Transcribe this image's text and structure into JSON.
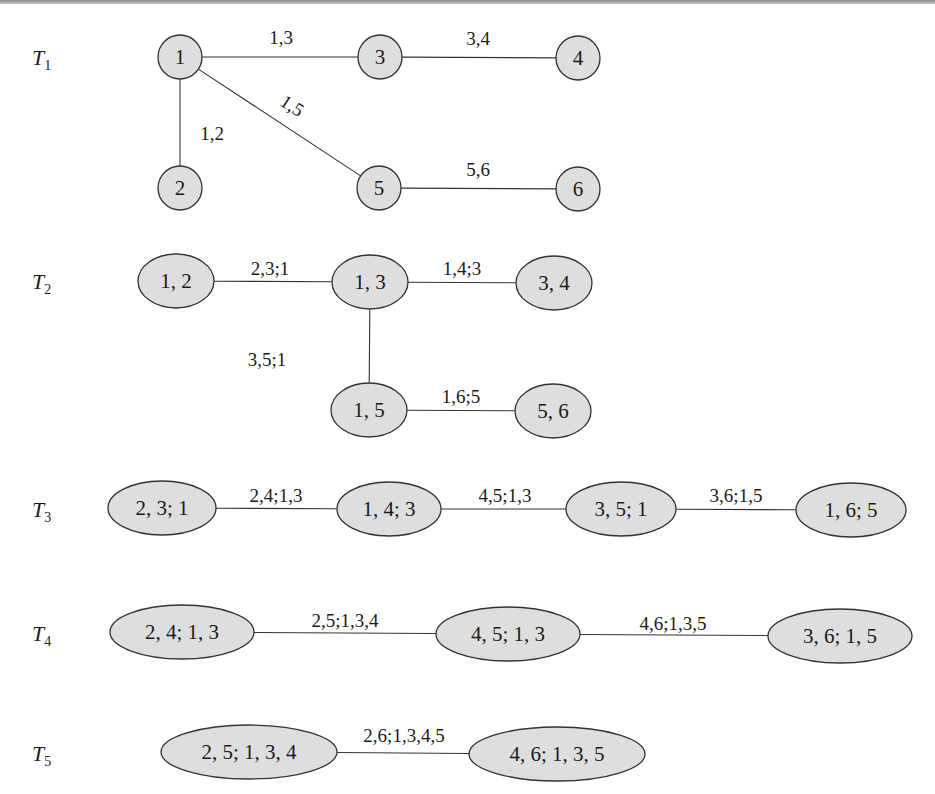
{
  "colors": {
    "node_fill": "#dedede",
    "stroke": "#333333",
    "text": "#1a1a1a"
  },
  "rows": [
    {
      "label": "T",
      "sub": "1",
      "label_pos": [
        32,
        65
      ],
      "nodes": [
        {
          "id": "n1",
          "text": "1",
          "cx": 180,
          "cy": 57,
          "rx": 22,
          "ry": 22
        },
        {
          "id": "n2",
          "text": "2",
          "cx": 180,
          "cy": 188,
          "rx": 22,
          "ry": 22
        },
        {
          "id": "n3",
          "text": "3",
          "cx": 380,
          "cy": 57,
          "rx": 22,
          "ry": 22
        },
        {
          "id": "n4",
          "text": "4",
          "cx": 578,
          "cy": 58,
          "rx": 22,
          "ry": 22
        },
        {
          "id": "n5",
          "text": "5",
          "cx": 379,
          "cy": 188,
          "rx": 22,
          "ry": 22
        },
        {
          "id": "n6",
          "text": "6",
          "cx": 578,
          "cy": 189,
          "rx": 22,
          "ry": 22
        }
      ],
      "edges": [
        {
          "from": "n1",
          "to": "n3",
          "text": "1,3",
          "lx": 281,
          "ly": 44,
          "rot": 0
        },
        {
          "from": "n3",
          "to": "n4",
          "text": "3,4",
          "lx": 478,
          "ly": 45,
          "rot": 0
        },
        {
          "from": "n1",
          "to": "n2",
          "text": "1,2",
          "lx": 212,
          "ly": 140,
          "rot": 0
        },
        {
          "from": "n1",
          "to": "n5",
          "text": "1,5",
          "lx": 292,
          "ly": 112,
          "rot": 33
        },
        {
          "from": "n5",
          "to": "n6",
          "text": "5,6",
          "lx": 478,
          "ly": 176,
          "rot": 0
        }
      ]
    },
    {
      "label": "T",
      "sub": "2",
      "label_pos": [
        32,
        289
      ],
      "nodes": [
        {
          "id": "a",
          "text": "1, 2",
          "cx": 176,
          "cy": 281,
          "rx": 38,
          "ry": 27
        },
        {
          "id": "b",
          "text": "1, 3",
          "cx": 370,
          "cy": 282,
          "rx": 38,
          "ry": 27
        },
        {
          "id": "c",
          "text": "3, 4",
          "cx": 554,
          "cy": 283,
          "rx": 38,
          "ry": 27
        },
        {
          "id": "d",
          "text": "1, 5",
          "cx": 369,
          "cy": 410,
          "rx": 38,
          "ry": 27
        },
        {
          "id": "e",
          "text": "5, 6",
          "cx": 553,
          "cy": 411,
          "rx": 38,
          "ry": 27
        }
      ],
      "edges": [
        {
          "from": "a",
          "to": "b",
          "text": "2,3;1",
          "lx": 270,
          "ly": 275,
          "rot": 0
        },
        {
          "from": "b",
          "to": "c",
          "text": "1,4;3",
          "lx": 462,
          "ly": 275,
          "rot": 0
        },
        {
          "from": "b",
          "to": "d",
          "text": "3,5;1",
          "lx": 267,
          "ly": 366,
          "rot": 0
        },
        {
          "from": "d",
          "to": "e",
          "text": "1,6;5",
          "lx": 461,
          "ly": 403,
          "rot": 0
        }
      ]
    },
    {
      "label": "T",
      "sub": "3",
      "label_pos": [
        32,
        517
      ],
      "nodes": [
        {
          "id": "a",
          "text": "2, 3; 1",
          "cx": 162,
          "cy": 508,
          "rx": 54,
          "ry": 27
        },
        {
          "id": "b",
          "text": "1, 4; 3",
          "cx": 389,
          "cy": 509,
          "rx": 52,
          "ry": 27
        },
        {
          "id": "c",
          "text": "3, 5; 1",
          "cx": 621,
          "cy": 509,
          "rx": 55,
          "ry": 27
        },
        {
          "id": "d",
          "text": "1, 6; 5",
          "cx": 851,
          "cy": 510,
          "rx": 55,
          "ry": 27
        }
      ],
      "edges": [
        {
          "from": "a",
          "to": "b",
          "text": "2,4;1,3",
          "lx": 276,
          "ly": 502,
          "rot": 0
        },
        {
          "from": "b",
          "to": "c",
          "text": "4,5;1,3",
          "lx": 505,
          "ly": 502,
          "rot": 0
        },
        {
          "from": "c",
          "to": "d",
          "text": "3,6;1,5",
          "lx": 736,
          "ly": 502,
          "rot": 0
        }
      ]
    },
    {
      "label": "T",
      "sub": "4",
      "label_pos": [
        32,
        641
      ],
      "nodes": [
        {
          "id": "a",
          "text": "2, 4; 1, 3",
          "cx": 182,
          "cy": 632,
          "rx": 72,
          "ry": 27
        },
        {
          "id": "b",
          "text": "4, 5; 1, 3",
          "cx": 508,
          "cy": 634,
          "rx": 72,
          "ry": 27
        },
        {
          "id": "c",
          "text": "3, 6; 1, 5",
          "cx": 840,
          "cy": 636,
          "rx": 72,
          "ry": 27
        }
      ],
      "edges": [
        {
          "from": "a",
          "to": "b",
          "text": "2,5;1,3,4",
          "lx": 345,
          "ly": 627,
          "rot": 0
        },
        {
          "from": "b",
          "to": "c",
          "text": "4,6;1,3,5",
          "lx": 673,
          "ly": 630,
          "rot": 0
        }
      ]
    },
    {
      "label": "T",
      "sub": "5",
      "label_pos": [
        32,
        761
      ],
      "nodes": [
        {
          "id": "a",
          "text": "2, 5; 1, 3, 4",
          "cx": 249,
          "cy": 752,
          "rx": 88,
          "ry": 27
        },
        {
          "id": "b",
          "text": "4, 6; 1, 3, 5",
          "cx": 557,
          "cy": 754,
          "rx": 88,
          "ry": 27
        }
      ],
      "edges": [
        {
          "from": "a",
          "to": "b",
          "text": "2,6;1,3,4,5",
          "lx": 404,
          "ly": 742,
          "rot": 0
        }
      ]
    }
  ]
}
